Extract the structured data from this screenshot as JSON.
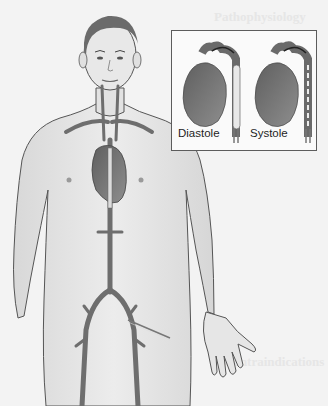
{
  "figure": {
    "type": "medical-illustration",
    "palette": {
      "background": "#f3f3f3",
      "skin": "#e4e4e4",
      "skin_outline": "#555555",
      "vessel": "#6e6e6e",
      "heart": "#7a7a7a",
      "balloon": "#dcdcdc",
      "inset_border": "#5c5c5c"
    }
  },
  "inset": {
    "panels": [
      {
        "label": "Diastole",
        "balloon_state": "inflated"
      },
      {
        "label": "Systole",
        "balloon_state": "deflated"
      }
    ]
  },
  "background_text": {
    "heading_top": "Pathophysiology",
    "heading_bottom": "Contraindications"
  }
}
